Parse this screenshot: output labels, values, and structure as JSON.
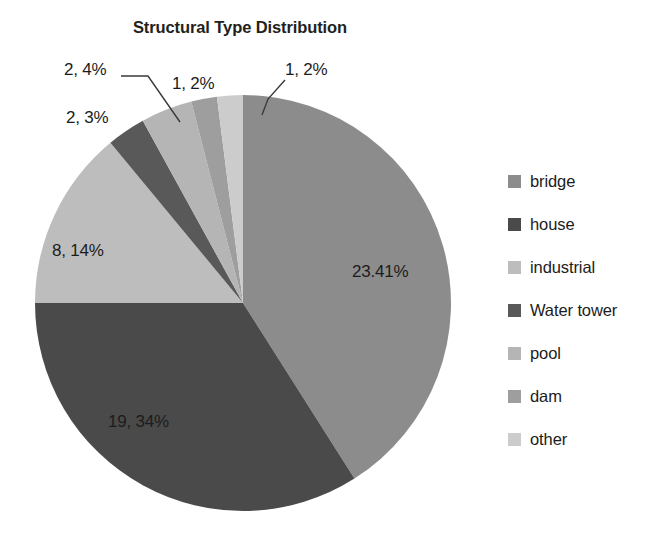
{
  "chart_data": {
    "type": "pie",
    "title": "Structural Type Distribution",
    "categories": [
      "bridge",
      "house",
      "industrial",
      "Water tower",
      "pool",
      "dam",
      "other"
    ],
    "counts": [
      23,
      19,
      8,
      2,
      2,
      1,
      1
    ],
    "percentages": [
      41,
      34,
      14,
      3,
      4,
      2,
      2
    ],
    "values": [
      41,
      34,
      14,
      3,
      4,
      2,
      2
    ],
    "data_labels": [
      "23.41%",
      "19, 34%",
      "8, 14%",
      "2, 3%",
      "2, 4%",
      "1, 2%",
      "1, 2%"
    ],
    "colors": [
      "#8c8c8c",
      "#4a4a4a",
      "#bdbdbd",
      "#595959",
      "#b5b5b5",
      "#9e9e9e",
      "#cccccc"
    ],
    "legend_position": "right",
    "grid": false,
    "xlabel": "",
    "ylabel": ""
  },
  "title": "Structural Type Distribution",
  "legend": {
    "items": [
      {
        "label": "bridge",
        "color": "#8c8c8c"
      },
      {
        "label": "house",
        "color": "#4a4a4a"
      },
      {
        "label": "industrial",
        "color": "#bdbdbd"
      },
      {
        "label": "Water tower",
        "color": "#595959"
      },
      {
        "label": "pool",
        "color": "#b5b5b5"
      },
      {
        "label": "dam",
        "color": "#9e9e9e"
      },
      {
        "label": "other",
        "color": "#cccccc"
      }
    ]
  },
  "labels": {
    "bridge": "23.41%",
    "house": "19, 34%",
    "industrial": "8, 14%",
    "water_tower": "2, 3%",
    "pool": "2, 4%",
    "dam": "1, 2%",
    "other": "1, 2%"
  }
}
